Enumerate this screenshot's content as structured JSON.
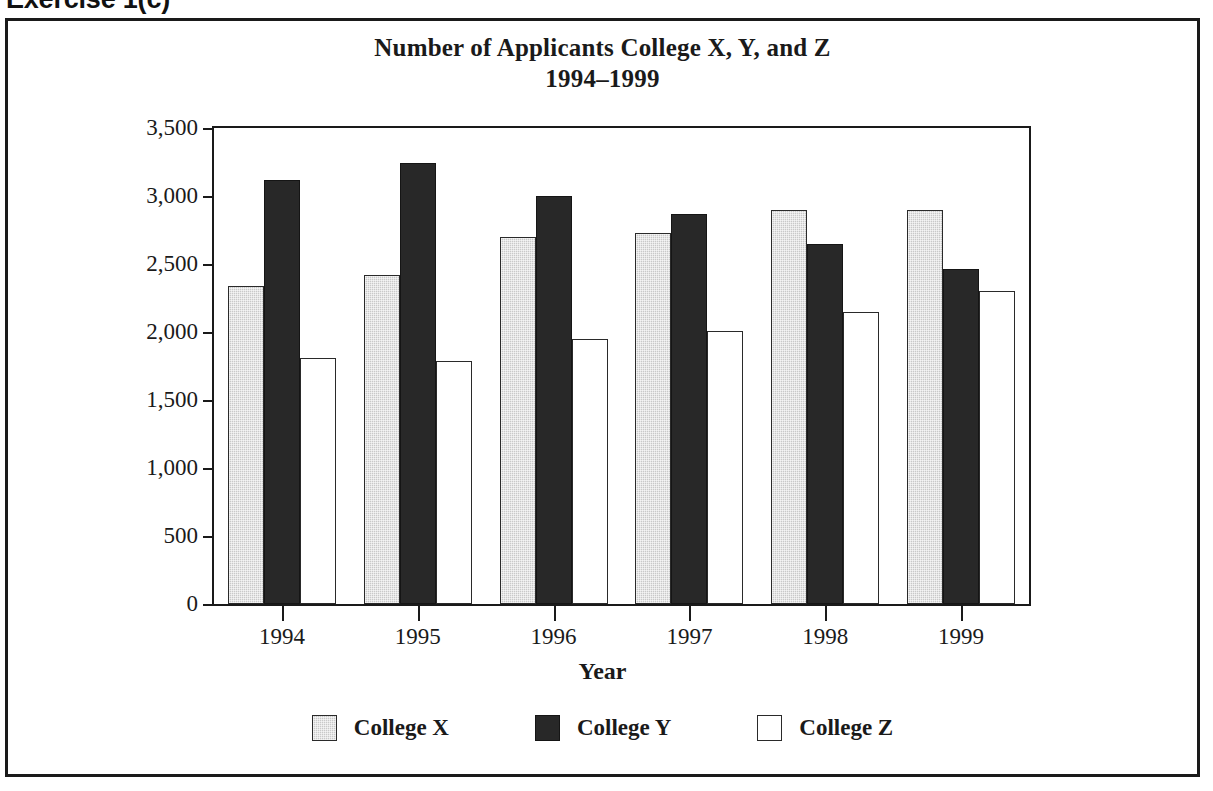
{
  "exercise_heading": "Exercise 1(c)",
  "chart_data": {
    "type": "bar",
    "title": "Number of Applicants College X, Y, and Z",
    "subtitle": "1994–1999",
    "xlabel": "Year",
    "ylabel": "",
    "categories": [
      "1994",
      "1995",
      "1996",
      "1997",
      "1998",
      "1999"
    ],
    "series": [
      {
        "name": "College X",
        "color": "#c9c9c9",
        "values": [
          2340,
          2420,
          2700,
          2730,
          2900,
          2900
        ]
      },
      {
        "name": "College Y",
        "color": "#282828",
        "values": [
          3120,
          3240,
          3000,
          2870,
          2650,
          2460
        ]
      },
      {
        "name": "College Z",
        "color": "#ffffff",
        "values": [
          1810,
          1790,
          1950,
          2010,
          2150,
          2300
        ]
      }
    ],
    "ylim": [
      0,
      3500
    ],
    "ytick_values": [
      0,
      500,
      1000,
      1500,
      2000,
      2500,
      3000,
      3500
    ],
    "ytick_labels": [
      "0",
      "500",
      "1,000",
      "1,500",
      "2,000",
      "2,500",
      "3,000",
      "3,500"
    ],
    "grid": false,
    "legend_position": "bottom",
    "legend_entries": [
      "College X",
      "College Y",
      "College Z"
    ]
  }
}
